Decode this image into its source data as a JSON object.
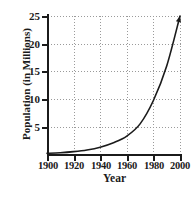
{
  "chart_data": {
    "type": "line",
    "title": "",
    "xlabel": "Year",
    "ylabel": "Population (in Millions)",
    "xlim": [
      1900,
      2000
    ],
    "ylim": [
      0,
      25
    ],
    "xticks": [
      "1900",
      "1920",
      "1940",
      "1960",
      "1980",
      "2000"
    ],
    "yticks": [
      "5",
      "10",
      "15",
      "20",
      "25"
    ],
    "grid": true,
    "legend": null,
    "annotations": [
      "arrowhead at curve end (2000, 25)"
    ],
    "series": [
      {
        "name": "Population",
        "x": [
          1900,
          1910,
          1920,
          1930,
          1940,
          1950,
          1960,
          1970,
          1980,
          1990,
          2000
        ],
        "values": [
          0.3,
          0.4,
          0.6,
          0.9,
          1.4,
          2.2,
          3.4,
          5.6,
          9.8,
          16.0,
          25.0
        ]
      }
    ]
  },
  "axes": {
    "y_title": "Population (in Millions)",
    "x_title": "Year",
    "y_ticks": [
      {
        "label": "25",
        "value": 25
      },
      {
        "label": "20",
        "value": 20
      },
      {
        "label": "15",
        "value": 15
      },
      {
        "label": "10",
        "value": 10
      },
      {
        "label": "5",
        "value": 5
      }
    ],
    "x_ticks": [
      {
        "label": "1900",
        "value": 1900
      },
      {
        "label": "1920",
        "value": 1920
      },
      {
        "label": "1940",
        "value": 1940
      },
      {
        "label": "1960",
        "value": 1960
      },
      {
        "label": "1980",
        "value": 1980
      },
      {
        "label": "2000",
        "value": 2000
      }
    ]
  },
  "colors": {
    "axis": "#1b1b1b",
    "grid": "#9a9a9a",
    "curve": "#1b1b1b",
    "background": "#ffffff"
  }
}
